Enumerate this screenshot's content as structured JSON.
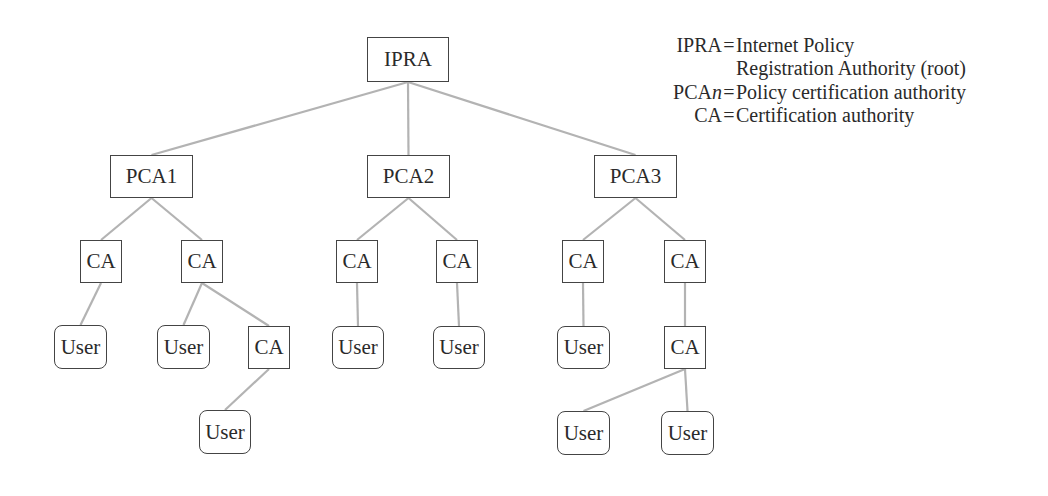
{
  "colors": {
    "edge": "#b3b3b3",
    "border": "#444444",
    "text": "#2a2a2a"
  },
  "nodes": [
    {
      "id": "ipra",
      "label": "IPRA",
      "type": "authority",
      "x": 367,
      "y": 37,
      "w": 82,
      "h": 45
    },
    {
      "id": "pca1",
      "label": "PCA1",
      "type": "authority",
      "x": 110,
      "y": 155,
      "w": 83,
      "h": 43
    },
    {
      "id": "pca2",
      "label": "PCA2",
      "type": "authority",
      "x": 367,
      "y": 155,
      "w": 83,
      "h": 43
    },
    {
      "id": "pca3",
      "label": "PCA3",
      "type": "authority",
      "x": 594,
      "y": 155,
      "w": 83,
      "h": 43
    },
    {
      "id": "ca1",
      "label": "CA",
      "type": "authority",
      "x": 80,
      "y": 240,
      "w": 42,
      "h": 43
    },
    {
      "id": "ca2",
      "label": "CA",
      "type": "authority",
      "x": 181,
      "y": 240,
      "w": 42,
      "h": 43
    },
    {
      "id": "ca3",
      "label": "CA",
      "type": "authority",
      "x": 336,
      "y": 240,
      "w": 42,
      "h": 43
    },
    {
      "id": "ca4",
      "label": "CA",
      "type": "authority",
      "x": 436,
      "y": 240,
      "w": 42,
      "h": 43
    },
    {
      "id": "ca5",
      "label": "CA",
      "type": "authority",
      "x": 562,
      "y": 240,
      "w": 42,
      "h": 43
    },
    {
      "id": "ca6",
      "label": "CA",
      "type": "authority",
      "x": 664,
      "y": 240,
      "w": 42,
      "h": 43
    },
    {
      "id": "user1",
      "label": "User",
      "type": "user",
      "x": 54,
      "y": 325,
      "w": 53,
      "h": 44
    },
    {
      "id": "user2",
      "label": "User",
      "type": "user",
      "x": 157,
      "y": 325,
      "w": 53,
      "h": 44
    },
    {
      "id": "ca7",
      "label": "CA",
      "type": "authority",
      "x": 248,
      "y": 326,
      "w": 42,
      "h": 43
    },
    {
      "id": "user3",
      "label": "User",
      "type": "user",
      "x": 332,
      "y": 326,
      "w": 52,
      "h": 43
    },
    {
      "id": "user4",
      "label": "User",
      "type": "user",
      "x": 433,
      "y": 326,
      "w": 52,
      "h": 43
    },
    {
      "id": "user5",
      "label": "User",
      "type": "user",
      "x": 557,
      "y": 326,
      "w": 53,
      "h": 43
    },
    {
      "id": "ca8",
      "label": "CA",
      "type": "authority",
      "x": 664,
      "y": 326,
      "w": 42,
      "h": 43
    },
    {
      "id": "user6",
      "label": "User",
      "type": "user",
      "x": 199,
      "y": 410,
      "w": 52,
      "h": 44
    },
    {
      "id": "user7",
      "label": "User",
      "type": "user",
      "x": 557,
      "y": 411,
      "w": 53,
      "h": 44
    },
    {
      "id": "user8",
      "label": "User",
      "type": "user",
      "x": 661,
      "y": 411,
      "w": 53,
      "h": 44
    }
  ],
  "edges": [
    [
      "ipra",
      "pca1"
    ],
    [
      "ipra",
      "pca2"
    ],
    [
      "ipra",
      "pca3"
    ],
    [
      "pca1",
      "ca1"
    ],
    [
      "pca1",
      "ca2"
    ],
    [
      "pca2",
      "ca3"
    ],
    [
      "pca2",
      "ca4"
    ],
    [
      "pca3",
      "ca5"
    ],
    [
      "pca3",
      "ca6"
    ],
    [
      "ca1",
      "user1"
    ],
    [
      "ca2",
      "user2"
    ],
    [
      "ca2",
      "ca7"
    ],
    [
      "ca7",
      "user6"
    ],
    [
      "ca3",
      "user3"
    ],
    [
      "ca4",
      "user4"
    ],
    [
      "ca5",
      "user5"
    ],
    [
      "ca6",
      "ca8"
    ],
    [
      "ca8",
      "user7"
    ],
    [
      "ca8",
      "user8"
    ]
  ],
  "legend": [
    {
      "term": "IPRA",
      "term_italic": "",
      "def": "Internet Policy"
    },
    {
      "term": "",
      "term_italic": "",
      "def": "Registration Authority (root)",
      "continuation": true
    },
    {
      "term": "PCA",
      "term_italic": "n",
      "def": "Policy certification authority"
    },
    {
      "term": "CA",
      "term_italic": "",
      "def": "Certification authority"
    }
  ],
  "legend_eq": "="
}
